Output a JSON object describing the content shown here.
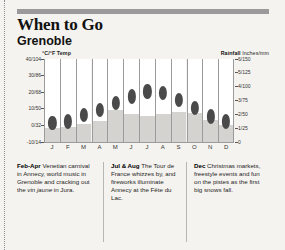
{
  "header": {
    "title": "When to Go",
    "subtitle": "Grenoble"
  },
  "legend": {
    "left": "°C/°F Temp",
    "right_bold": "Rainfall",
    "right_rest": " Inches/mm"
  },
  "chart_data": {
    "type": "bar",
    "subtitle": "Grenoble",
    "xlabel": "",
    "ylabel": "°C/°F Temp",
    "y2label": "Rainfall Inches/mm",
    "grid": false,
    "legend_position": "top",
    "categories": [
      "J",
      "F",
      "M",
      "A",
      "M",
      "J",
      "J",
      "A",
      "S",
      "O",
      "N",
      "D"
    ],
    "month_names": [
      "January",
      "February",
      "March",
      "April",
      "May",
      "June",
      "July",
      "August",
      "September",
      "October",
      "November",
      "December"
    ],
    "ylim": [
      -10,
      40
    ],
    "y_ticks": [
      "-10/14",
      "0/32",
      "10/50",
      "20/68",
      "30/86",
      "40/104"
    ],
    "y_tick_values": [
      -10,
      0,
      10,
      20,
      30,
      40
    ],
    "y2lim": [
      0,
      6
    ],
    "y2_ticks": [
      "0",
      "1/25",
      "2/50",
      "3/75",
      "4/100",
      "5/125",
      "6/150"
    ],
    "y2_tick_values": [
      0,
      1,
      2,
      3,
      4,
      5,
      6
    ],
    "series": [
      {
        "name": "Rainfall",
        "unit": "inches",
        "type": "bar",
        "axis": "right",
        "values": [
          1.0,
          1.1,
          1.3,
          1.5,
          2.3,
          2.0,
          1.9,
          2.0,
          2.2,
          2.1,
          1.6,
          1.2
        ]
      },
      {
        "name": "Temp",
        "unit": "°C",
        "type": "marker",
        "axis": "left",
        "values": [
          1,
          2,
          6,
          9,
          13,
          17,
          20,
          19,
          15,
          10,
          5,
          2
        ]
      }
    ]
  },
  "blurbs": [
    {
      "lead": "Feb-Apr",
      "text_a": " Venetian carnival in Annecy, world music in Grenoble and cracking out the ",
      "italic": "vin jaune",
      "text_b": " in Jura."
    },
    {
      "lead": "Jul & Aug",
      "text_a": " The Tour de France whizzes by, and fireworks illuminate Annecy at the Fête du Lac.",
      "italic": "",
      "text_b": ""
    },
    {
      "lead": "Dec",
      "text_a": " Christmas markets, freestyle events and fun on the pistes as the first big snows fall.",
      "italic": "",
      "text_b": ""
    }
  ],
  "colors": {
    "rule": "#9a9a9a",
    "rain_bar": "#d5d3cf",
    "temp_dot": "#4a4a4a",
    "column": "#ffffff",
    "page": "#f5f3ef"
  }
}
